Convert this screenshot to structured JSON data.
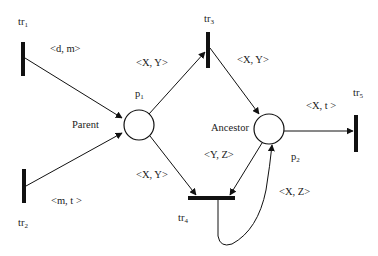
{
  "diagram": {
    "type": "petri-net",
    "places": [
      {
        "id": "p1",
        "label": "p",
        "sub": "1",
        "name": "Parent"
      },
      {
        "id": "p2",
        "label": "p",
        "sub": "2",
        "name": "Ancestor"
      }
    ],
    "transitions": [
      {
        "id": "tr1",
        "label": "tr",
        "sub": "1"
      },
      {
        "id": "tr2",
        "label": "tr",
        "sub": "2"
      },
      {
        "id": "tr3",
        "label": "tr",
        "sub": "3"
      },
      {
        "id": "tr4",
        "label": "tr",
        "sub": "4"
      },
      {
        "id": "tr5",
        "label": "tr",
        "sub": "5"
      }
    ],
    "arcs": [
      {
        "from": "tr1",
        "to": "p1",
        "label": "<d, m>"
      },
      {
        "from": "tr2",
        "to": "p1",
        "label": "<m, t >"
      },
      {
        "from": "p1",
        "to": "tr3",
        "label": "<X, Y>"
      },
      {
        "from": "tr3",
        "to": "p2",
        "label": "<X, Y>"
      },
      {
        "from": "p1",
        "to": "tr4",
        "label": "<X, Y>"
      },
      {
        "from": "p2",
        "to": "tr4",
        "label": "<Y, Z>"
      },
      {
        "from": "tr4",
        "to": "p2",
        "label": "<X, Z>"
      },
      {
        "from": "p2",
        "to": "tr5",
        "label": "<X, t >"
      }
    ]
  }
}
